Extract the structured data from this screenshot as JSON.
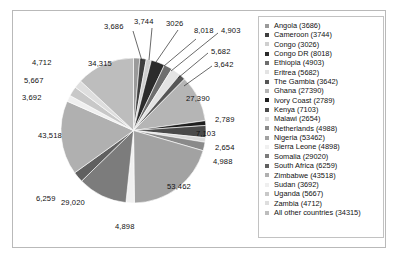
{
  "chart_data": {
    "type": "pie",
    "title": "",
    "units": "",
    "legend_position": "right",
    "label_format": "thousands-separated",
    "total": 339016,
    "categories": [
      "Angola",
      "Cameroon",
      "Congo",
      "Congo DR",
      "Ethiopia",
      "Eritrea",
      "The Gambia",
      "Ghana",
      "Ivory Coast",
      "Kenya",
      "Malawi",
      "Netherlands",
      "Nigeria",
      "Sierra Leone",
      "Somalia",
      "South Africa",
      "Zimbabwe",
      "Sudan",
      "Uganda",
      "Zambia",
      "All other countries"
    ],
    "values": [
      3686,
      3744,
      3026,
      8018,
      4903,
      5682,
      3642,
      27390,
      2789,
      7103,
      2654,
      4988,
      53462,
      4898,
      29020,
      6259,
      43518,
      3692,
      5667,
      4712,
      34315
    ],
    "slice_labels": [
      "3,686",
      "3,744",
      "3026",
      "8,018",
      "4,903",
      "5,682",
      "3,642",
      "27,390",
      "2,789",
      "7,103",
      "2,654",
      "4,988",
      "53,462",
      "4,898",
      "29,020",
      "6,259",
      "43,518",
      "3,692",
      "5,667",
      "4,712",
      "34,315"
    ],
    "legend_labels": [
      "Angola (3686)",
      "Cameroon (3744)",
      "Congo (3026)",
      "Congo DR (8018)",
      "Ethiopia (4903)",
      "Eritrea (5682)",
      "The Gambia (3642)",
      "Ghana (27390)",
      "Ivory Coast (2789)",
      "Kenya (7103)",
      "Malawi (2654)",
      "Netherlands (4988)",
      "Nigeria (53462)",
      "Sierra Leone (4898)",
      "Somalia (29020)",
      "South Africa (6259)",
      "Zimbabwe (43518)",
      "Sudan (3692)",
      "Uganda (5667)",
      "Zambia (4712)",
      "All other countries (34315)"
    ],
    "colors": [
      "#9a9a9a",
      "#3f3f3f",
      "#cfcfcf",
      "#2b2b2b",
      "#6e6e6e",
      "#e3e3e3",
      "#565656",
      "#b5b5b5",
      "#1f1f1f",
      "#4a4a4a",
      "#dadada",
      "#8a8a8a",
      "#a2a2a2",
      "#f0f0f0",
      "#7c7c7c",
      "#606060",
      "#b0b0b0",
      "#efefef",
      "#c8c8c8",
      "#dedede",
      "#bdbdbd"
    ]
  },
  "legend": {
    "swatch_name": "legend-color-swatch"
  }
}
